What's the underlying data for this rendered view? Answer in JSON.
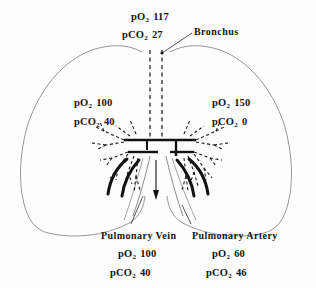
{
  "figure": {
    "background_color": "#fdfdfd",
    "outline_color": "#8a8a8a",
    "structure_color": "#111111"
  },
  "labels": {
    "trachea": {
      "po2_name": "pO",
      "po2_sub": "2",
      "po2_value": "117",
      "pco2_name": "pCO",
      "pco2_sub": "2",
      "pco2_value": "27"
    },
    "bronchus": {
      "name": "Bronchus"
    },
    "left_lung": {
      "po2_name": "pO",
      "po2_sub": "2",
      "po2_value": "100",
      "pco2_name": "pCO",
      "pco2_sub": "2",
      "pco2_value": "40"
    },
    "right_lung": {
      "po2_name": "pO",
      "po2_sub": "2",
      "po2_value": "150",
      "pco2_name": "pCO",
      "pco2_sub": "2",
      "pco2_value": "0"
    },
    "pulmonary_vein": {
      "name": "Pulmonary Vein",
      "po2_name": "pO",
      "po2_sub": "2",
      "po2_value": "100",
      "pco2_name": "pCO",
      "pco2_sub": "2",
      "pco2_value": "40"
    },
    "pulmonary_artery": {
      "name": "Pulmonary Artery",
      "po2_name": "pO",
      "po2_sub": "2",
      "po2_value": "60",
      "pco2_name": "pCO",
      "pco2_sub": "2",
      "pco2_value": "46"
    }
  }
}
